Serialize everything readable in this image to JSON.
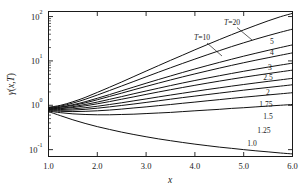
{
  "chart_data": {
    "type": "line",
    "title": "",
    "xlabel": "x",
    "ylabel": "γ(x,T)",
    "xlim": [
      1.0,
      6.0
    ],
    "ylim": [
      0.07,
      130
    ],
    "yscale": "log",
    "xscale": "linear",
    "grid": false,
    "legend": "inline-right-labels",
    "xticks": [
      "1.0",
      "2.0",
      "3.0",
      "4.0",
      "5.0",
      "6.0"
    ],
    "xtick_values": [
      1.0,
      2.0,
      3.0,
      4.0,
      5.0,
      6.0
    ],
    "yticks": [
      "10²",
      "10¹",
      "10⁰",
      "10⁻¹"
    ],
    "ytick_values": [
      100,
      10,
      1,
      0.1
    ],
    "ytick_mantissas": [
      "10",
      "10",
      "10",
      "10"
    ],
    "ytick_exponents": [
      "2",
      "1",
      "0",
      "-1"
    ],
    "annotations": [
      {
        "text": "T=20",
        "target_series": "20",
        "leader": true
      },
      {
        "text": "T=10",
        "target_series": "10",
        "leader": true
      }
    ],
    "x": [
      1.0,
      1.25,
      1.5,
      1.75,
      2.0,
      2.25,
      2.5,
      2.75,
      3.0,
      3.25,
      3.5,
      3.75,
      4.0,
      4.25,
      4.5,
      4.75,
      5.0,
      5.25,
      5.5,
      5.75,
      6.0
    ],
    "series": [
      {
        "name": "20",
        "label": "T=20",
        "values": [
          0.9,
          1.0,
          1.2,
          1.5,
          1.95,
          2.55,
          3.35,
          4.45,
          5.9,
          7.8,
          10.3,
          13.5,
          17.8,
          23.2,
          30.2,
          39.0,
          50.0,
          63.5,
          80.0,
          99.0,
          118.0
        ]
      },
      {
        "name": "10",
        "label": "T=10",
        "values": [
          0.88,
          0.96,
          1.12,
          1.36,
          1.7,
          2.15,
          2.72,
          3.45,
          4.38,
          5.55,
          7.0,
          8.8,
          11.0,
          13.7,
          17.0,
          21.0,
          25.6,
          31.0,
          37.2,
          44.2,
          52.0
        ]
      },
      {
        "name": "5",
        "label": "5",
        "values": [
          0.86,
          0.92,
          1.03,
          1.2,
          1.44,
          1.74,
          2.12,
          2.58,
          3.14,
          3.8,
          4.58,
          5.5,
          6.58,
          7.82,
          9.25,
          10.9,
          12.8,
          14.9,
          17.3,
          20.0,
          23.0
        ]
      },
      {
        "name": "4",
        "label": "4",
        "values": [
          0.85,
          0.9,
          0.99,
          1.13,
          1.33,
          1.58,
          1.88,
          2.24,
          2.66,
          3.15,
          3.72,
          4.37,
          5.1,
          5.93,
          6.87,
          7.92,
          9.1,
          10.4,
          11.8,
          13.4,
          15.2
        ]
      },
      {
        "name": "3",
        "label": "3",
        "values": [
          0.83,
          0.86,
          0.93,
          1.04,
          1.18,
          1.36,
          1.57,
          1.82,
          2.1,
          2.42,
          2.78,
          3.18,
          3.62,
          4.1,
          4.63,
          5.21,
          5.84,
          6.52,
          7.26,
          8.05,
          8.9
        ]
      },
      {
        "name": "2.5",
        "label": "2.5",
        "values": [
          0.82,
          0.84,
          0.89,
          0.97,
          1.08,
          1.21,
          1.37,
          1.55,
          1.76,
          1.99,
          2.24,
          2.52,
          2.82,
          3.15,
          3.5,
          3.88,
          4.29,
          4.72,
          5.18,
          5.67,
          6.2
        ]
      },
      {
        "name": "2",
        "label": "2",
        "values": [
          0.8,
          0.8,
          0.83,
          0.88,
          0.95,
          1.04,
          1.14,
          1.26,
          1.39,
          1.54,
          1.7,
          1.87,
          2.06,
          2.26,
          2.47,
          2.7,
          2.94,
          3.19,
          3.46,
          3.74,
          4.05
        ]
      },
      {
        "name": "1.75",
        "label": "1.75",
        "values": [
          0.78,
          0.77,
          0.78,
          0.81,
          0.86,
          0.92,
          0.99,
          1.07,
          1.16,
          1.26,
          1.37,
          1.49,
          1.61,
          1.74,
          1.88,
          2.03,
          2.19,
          2.35,
          2.52,
          2.7,
          2.9
        ]
      },
      {
        "name": "1.5",
        "label": "1.5",
        "values": [
          0.76,
          0.73,
          0.72,
          0.73,
          0.75,
          0.78,
          0.82,
          0.87,
          0.92,
          0.98,
          1.04,
          1.11,
          1.18,
          1.26,
          1.34,
          1.43,
          1.52,
          1.61,
          1.71,
          1.81,
          1.92
        ]
      },
      {
        "name": "1.25",
        "label": "1.25",
        "values": [
          0.74,
          0.68,
          0.64,
          0.62,
          0.61,
          0.61,
          0.62,
          0.63,
          0.65,
          0.67,
          0.69,
          0.72,
          0.75,
          0.78,
          0.81,
          0.85,
          0.88,
          0.92,
          0.96,
          1.0,
          1.04
        ]
      },
      {
        "name": "1.0",
        "label": "1.0",
        "values": [
          0.72,
          0.58,
          0.47,
          0.39,
          0.33,
          0.285,
          0.248,
          0.219,
          0.195,
          0.175,
          0.159,
          0.145,
          0.133,
          0.123,
          0.114,
          0.107,
          0.1,
          0.094,
          0.089,
          0.084,
          0.08
        ]
      }
    ]
  },
  "axes": {
    "x_title": "x",
    "y_title": "γ(x,T)",
    "y_title_parts": {
      "gamma": "γ",
      "open": "(",
      "x": "x",
      "comma": ",",
      "t": "T",
      "close": ")"
    }
  }
}
